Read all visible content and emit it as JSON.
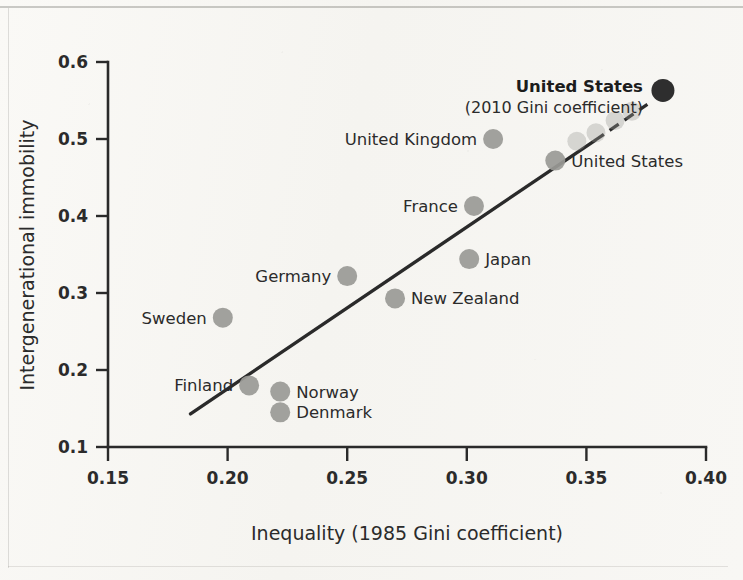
{
  "figure": {
    "background_color": "#f7f6f3",
    "ink_color": "#2b2b2b",
    "marker_color": "#9a9a96",
    "highlight_marker_color": "#2e2e2e"
  },
  "chart_data": {
    "type": "scatter",
    "title": "",
    "xlabel": "Inequality (1985 Gini coefficient)",
    "ylabel": "Intergenerational immobility",
    "xlim": [
      0.15,
      0.4
    ],
    "ylim": [
      0.1,
      0.6
    ],
    "xticks": [
      0.15,
      0.2,
      0.25,
      0.3,
      0.35,
      0.4
    ],
    "xtick_labels": [
      "0.15",
      "0.20",
      "0.25",
      "0.30",
      "0.35",
      "0.40"
    ],
    "yticks": [
      0.1,
      0.2,
      0.3,
      0.4,
      0.5,
      0.6
    ],
    "ytick_labels": [
      "0.1",
      "0.2",
      "0.3",
      "0.4",
      "0.5",
      "0.6"
    ],
    "grid": false,
    "legend": false,
    "points": [
      {
        "name": "Denmark",
        "x": 0.222,
        "y": 0.145,
        "label": "Denmark",
        "label_side": "right"
      },
      {
        "name": "Norway",
        "x": 0.222,
        "y": 0.172,
        "label": "Norway",
        "label_side": "right"
      },
      {
        "name": "Finland",
        "x": 0.209,
        "y": 0.18,
        "label": "Finland",
        "label_side": "left"
      },
      {
        "name": "Sweden",
        "x": 0.198,
        "y": 0.268,
        "label": "Sweden",
        "label_side": "left"
      },
      {
        "name": "New Zealand",
        "x": 0.27,
        "y": 0.293,
        "label": "New Zealand",
        "label_side": "right"
      },
      {
        "name": "Germany",
        "x": 0.25,
        "y": 0.322,
        "label": "Germany",
        "label_side": "left"
      },
      {
        "name": "Japan",
        "x": 0.301,
        "y": 0.344,
        "label": "Japan",
        "label_side": "right"
      },
      {
        "name": "France",
        "x": 0.303,
        "y": 0.413,
        "label": "France",
        "label_side": "left"
      },
      {
        "name": "United Kingdom",
        "x": 0.311,
        "y": 0.5,
        "label": "United Kingdom",
        "label_side": "left"
      },
      {
        "name": "United States",
        "x": 0.337,
        "y": 0.472,
        "label": "United States",
        "label_side": "right"
      }
    ],
    "faint_points": [
      {
        "x": 0.346,
        "y": 0.497
      },
      {
        "x": 0.354,
        "y": 0.508
      },
      {
        "x": 0.362,
        "y": 0.524
      },
      {
        "x": 0.369,
        "y": 0.536
      }
    ],
    "highlight_point": {
      "name": "United States (2010)",
      "x": 0.382,
      "y": 0.563,
      "annotation_bold": "United States",
      "annotation_sub": "(2010 Gini coefficient)"
    },
    "trendline": {
      "style": "solid-with-dashed-extension",
      "solid_from": {
        "x": 0.1845,
        "y": 0.143
      },
      "solid_to": {
        "x": 0.3535,
        "y": 0.498
      },
      "dashed_from": {
        "x": 0.3535,
        "y": 0.498
      },
      "dashed_to": {
        "x": 0.3755,
        "y": 0.545
      }
    }
  }
}
